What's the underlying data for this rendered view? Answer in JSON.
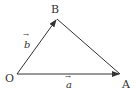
{
  "diagram": {
    "type": "vector-triangle",
    "points": {
      "O": {
        "label": "O",
        "x": 17,
        "y": 74
      },
      "A": {
        "label": "A",
        "x": 120,
        "y": 74
      },
      "B": {
        "label": "B",
        "x": 57,
        "y": 19
      }
    },
    "vectors": [
      {
        "from": "O",
        "to": "A",
        "label": "a",
        "arrow": "→"
      },
      {
        "from": "O",
        "to": "B",
        "label": "b",
        "arrow": "→"
      }
    ],
    "segments": [
      {
        "from": "B",
        "to": "A"
      }
    ],
    "stroke_color": "#333333",
    "background": "#ffffff"
  }
}
